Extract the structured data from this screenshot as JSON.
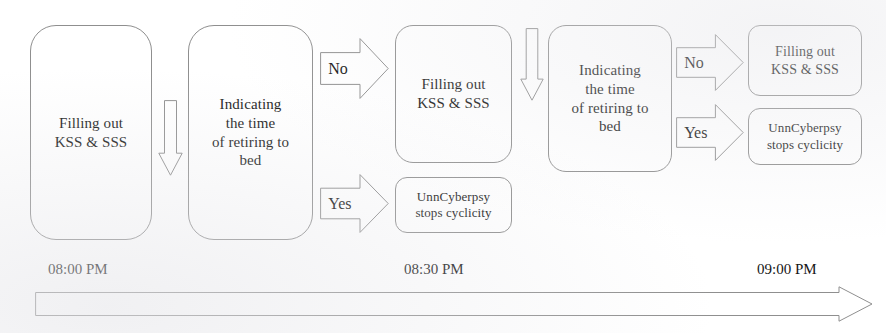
{
  "diagram": {
    "colors": {
      "stroke": "#8f8f8f",
      "text": "#191919",
      "background": "#ffffff"
    },
    "nodes": [
      {
        "id": "node-fill-kss-sss-1",
        "name": "box-filling-out-kss-sss-1",
        "lines": [
          "Filling out",
          "KSS & SSS"
        ],
        "x": 30,
        "y": 25,
        "w": 122,
        "h": 215,
        "shape": "tall",
        "font_size": 15
      },
      {
        "id": "node-indicating-time-1",
        "name": "box-indicating-time-of-retiring-1",
        "lines": [
          "Indicating",
          "the time",
          "of retiring to",
          "bed"
        ],
        "x": 188,
        "y": 25,
        "w": 125,
        "h": 215,
        "shape": "tall",
        "font_size": 15
      },
      {
        "id": "node-fill-kss-sss-2",
        "name": "box-filling-out-kss-sss-2",
        "lines": [
          "Filling out",
          "KSS & SSS"
        ],
        "x": 395,
        "y": 25,
        "w": 117,
        "h": 138,
        "shape": "mid",
        "font_size": 15
      },
      {
        "id": "node-stops-cyclicity-1",
        "name": "box-unncyberpsy-stops-cyclicity-1",
        "lines": [
          "UnnCyberpsy",
          "stops cyclicity"
        ],
        "x": 395,
        "y": 177,
        "w": 117,
        "h": 56,
        "shape": "small",
        "font_size": 13
      },
      {
        "id": "node-indicating-time-2",
        "name": "box-indicating-time-of-retiring-2",
        "lines": [
          "Indicating",
          "the time",
          "of retiring to",
          "bed"
        ],
        "x": 548,
        "y": 25,
        "w": 124,
        "h": 147,
        "shape": "mid",
        "font_size": 15
      },
      {
        "id": "node-fill-kss-sss-3",
        "name": "box-filling-out-kss-sss-3",
        "lines": [
          "Filling out",
          "KSS & SSS"
        ],
        "x": 748,
        "y": 25,
        "w": 114,
        "h": 71,
        "shape": "small",
        "font_size": 14
      },
      {
        "id": "node-stops-cyclicity-2",
        "name": "box-unncyberpsy-stops-cyclicity-2",
        "lines": [
          "UnnCyberpsy",
          "stops cyclicity"
        ],
        "x": 748,
        "y": 108,
        "w": 114,
        "h": 57,
        "shape": "small",
        "font_size": 13
      }
    ],
    "arrows": [
      {
        "id": "arrow-1",
        "name": "arrow-plain-1",
        "label": "",
        "x": 158,
        "y": 100,
        "w": 25,
        "h": 76,
        "font_size": 14
      },
      {
        "id": "arrow-no-1",
        "name": "arrow-no-1",
        "label": "No",
        "x": 320,
        "y": 38,
        "w": 69,
        "h": 61,
        "font_size": 16
      },
      {
        "id": "arrow-yes-1",
        "name": "arrow-yes-1",
        "label": "Yes",
        "x": 320,
        "y": 174,
        "w": 69,
        "h": 59,
        "font_size": 16
      },
      {
        "id": "arrow-2",
        "name": "arrow-plain-2",
        "label": "",
        "x": 520,
        "y": 28,
        "w": 24,
        "h": 73,
        "font_size": 14
      },
      {
        "id": "arrow-no-2",
        "name": "arrow-no-2",
        "label": "No",
        "x": 676,
        "y": 34,
        "w": 68,
        "h": 57,
        "font_size": 16
      },
      {
        "id": "arrow-yes-2",
        "name": "arrow-yes-2",
        "label": "Yes",
        "x": 676,
        "y": 104,
        "w": 68,
        "h": 57,
        "font_size": 16
      }
    ],
    "timeline": {
      "name": "timeline-axis",
      "labels": [
        {
          "text": "08:00 PM",
          "x": 48,
          "y": 261,
          "font_size": 15
        },
        {
          "text": "08:30 PM",
          "x": 404,
          "y": 261,
          "font_size": 15
        },
        {
          "text": "09:00 PM",
          "x": 757,
          "y": 261,
          "font_size": 15
        }
      ],
      "bar": {
        "x": 35,
        "y": 286,
        "w": 838,
        "h": 36
      }
    }
  }
}
